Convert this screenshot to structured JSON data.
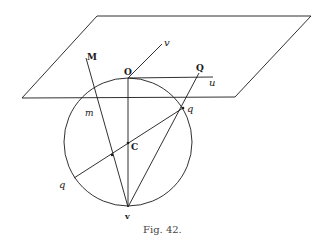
{
  "figure": {
    "caption": "Fig. 42.",
    "labels": {
      "M": "M",
      "v": "v",
      "O": "O",
      "Q": "Q",
      "u": "u",
      "m": "m",
      "q_right": "q",
      "C": "C",
      "q_left": "q",
      "V": "v"
    },
    "colors": {
      "ink": "#1a1a1a",
      "background": "#ffffff"
    }
  }
}
